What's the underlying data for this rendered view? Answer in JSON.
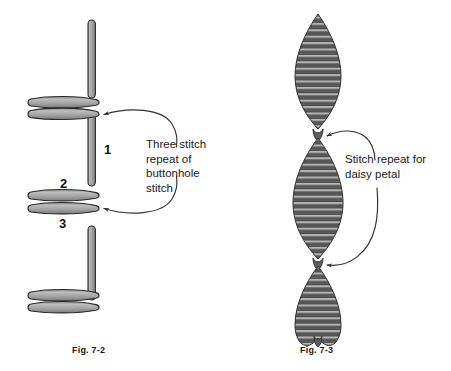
{
  "page": {
    "background": "#ffffff",
    "width": 451,
    "height": 371
  },
  "colors": {
    "thread_fill": "#9d9d9d",
    "thread_fill_light": "#c8c8c8",
    "thread_fill_dark": "#6f6f6f",
    "outline": "#2b2b2b",
    "petal_dark": "#4a4a4a",
    "petal_light": "#a8a8a8",
    "text": "#1a1a1a",
    "arrow": "#333333"
  },
  "figures": [
    {
      "id": "fig-7-2",
      "caption": "Fig. 7-2",
      "subject": "buttonhole stitch",
      "annotation": "Three stitch\nrepeat of\nbuttonhole\nstitch",
      "annotation_lines": [
        "Three stitch",
        "repeat of",
        "buttonhole",
        "stitch"
      ],
      "step_labels": [
        {
          "name": "step-1",
          "text": "1"
        },
        {
          "name": "step-2",
          "text": "2"
        },
        {
          "name": "step-3",
          "text": "3"
        }
      ],
      "vertical_bars": 4,
      "horizontal_bar_pairs": 3,
      "arrow_count": 2
    },
    {
      "id": "fig-7-3",
      "caption": "Fig. 7-3",
      "subject": "daisy petal stitch",
      "annotation": "Stitch repeat for\ndaisy petal",
      "annotation_lines": [
        "Stitch repeat for",
        "daisy petal"
      ],
      "petal_count": 3,
      "stitches_per_petal": 34,
      "arrow_count": 2
    }
  ],
  "icons": {
    "arrow_head": "arrow-head-icon"
  }
}
